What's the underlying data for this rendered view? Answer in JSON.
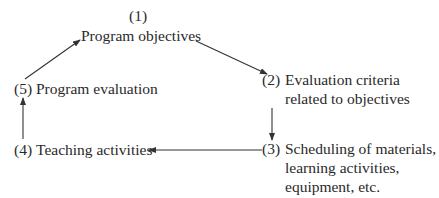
{
  "diagram": {
    "type": "cycle-flow",
    "nodes": [
      {
        "id": "1",
        "number": "(1)",
        "lines": [
          "Program objectives"
        ]
      },
      {
        "id": "2",
        "number": "(2)",
        "lines": [
          "Evaluation criteria",
          "related to objectives"
        ]
      },
      {
        "id": "3",
        "number": "(3)",
        "lines": [
          "Scheduling of materials,",
          "learning activities,",
          "equipment, etc."
        ]
      },
      {
        "id": "4",
        "number": "(4)",
        "lines": [
          "Teaching activities"
        ]
      },
      {
        "id": "5",
        "number": "(5)",
        "lines": [
          "Program evaluation"
        ]
      }
    ],
    "edges": [
      {
        "from": "1",
        "to": "2"
      },
      {
        "from": "2",
        "to": "3"
      },
      {
        "from": "3",
        "to": "4"
      },
      {
        "from": "4",
        "to": "5"
      },
      {
        "from": "5",
        "to": "1"
      }
    ],
    "colors": {
      "text": "#2a2a2a",
      "line": "#333333",
      "background": "#ffffff"
    }
  }
}
